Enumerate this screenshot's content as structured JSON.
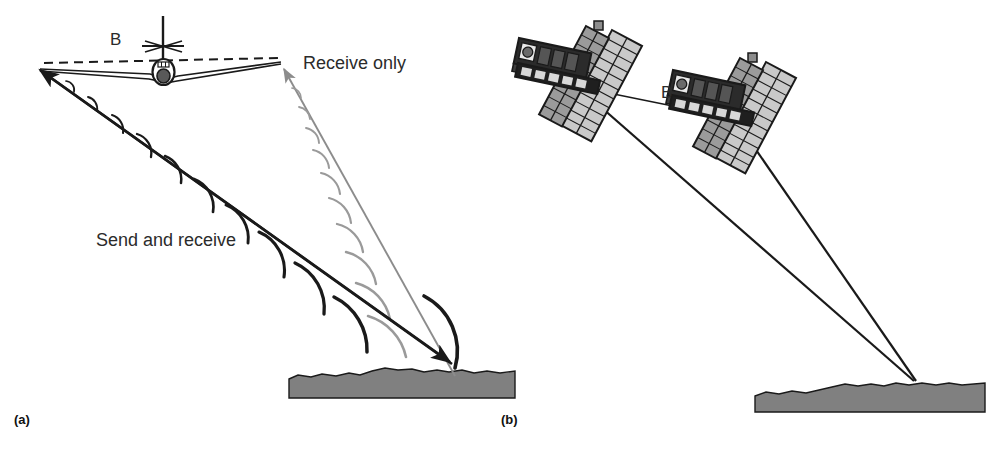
{
  "figure": {
    "background": "#ffffff",
    "width": 989,
    "height": 450
  },
  "colors": {
    "ink": "#1a1a1a",
    "send_beam": "#1a1a1a",
    "receive_beam": "#8c8c8c",
    "wave_dark": "#1a1a1a",
    "wave_light": "#9a9a9a",
    "ground_fill": "#808080",
    "ground_stroke": "#1a1a1a",
    "panel_light": "#c9c9c9",
    "panel_mid": "#9b9b9b",
    "body_dark": "#1f1f1f",
    "text": "#2b2b2b",
    "baseline_dash": "#1a1a1a"
  },
  "panel_a": {
    "id": "a",
    "caption": "(a)",
    "platform": "aircraft",
    "labels": {
      "baseline": "B",
      "send_beam": "Send and receive",
      "receive_beam": "Receive only"
    },
    "geometry": {
      "antenna_left": [
        38,
        68
      ],
      "antenna_right": [
        281,
        62
      ],
      "aircraft_center": [
        163,
        68
      ],
      "ground_target": [
        452,
        362
      ],
      "baseline_dashed_from": [
        41,
        62
      ],
      "baseline_dashed_to": [
        281,
        58
      ],
      "ground_bar": {
        "x": 289,
        "y": 372,
        "width": 226,
        "height": 26
      }
    },
    "wave_arc_count_send": 11,
    "wave_arc_count_receive": 10
  },
  "panel_b": {
    "id": "b",
    "caption": "(b)",
    "platform": "satellite",
    "labels": {
      "baseline": "B"
    },
    "geometry": {
      "satellite_1_antenna": [
        580,
        86
      ],
      "satellite_2_antenna": [
        731,
        117
      ],
      "ground_target": [
        914,
        380
      ],
      "ground_bar": {
        "x": 755,
        "y": 388,
        "width": 230,
        "height": 24
      }
    },
    "satellites": [
      {
        "name": "satellite-1",
        "body_x": 519,
        "body_y": 41,
        "panel_cells": 11
      },
      {
        "name": "satellite-2",
        "body_x": 673,
        "body_y": 73,
        "panel_cells": 11
      }
    ]
  },
  "icons": {
    "aircraft": "aircraft-icon",
    "satellite": "satellite-icon",
    "ground": "ground-terrain-icon",
    "wave": "radar-wavefront-icon",
    "arrow": "arrow-icon"
  }
}
